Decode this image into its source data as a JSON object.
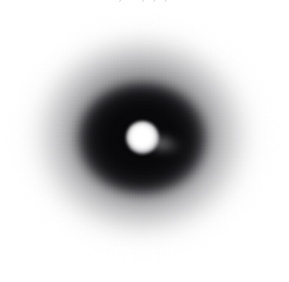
{
  "figure": {
    "kind": "diffraction-pattern-scan",
    "width": 289,
    "height": 282,
    "background_color": "#ffffff",
    "top_clipped_text": ". , . , , , .",
    "ghost_text_lines": [
      "",
      "",
      ""
    ],
    "features": {
      "center_spot": {
        "label": "direct-beam-spot",
        "center_x": 142,
        "center_y": 137,
        "radius": 13,
        "color": "#ffffff"
      },
      "dark_ring": {
        "label": "dark-diffraction-annulus",
        "center_x": 142,
        "center_y": 138,
        "radius_x": 70,
        "radius_y": 62,
        "color": "#0c0c0e"
      },
      "mid_halo": {
        "label": "diffuse-scatter-halo",
        "center_x": 143,
        "center_y": 139,
        "radius_x": 117,
        "radius_y": 108,
        "color": "#686869"
      },
      "outer_halo": {
        "label": "outer-scatter-falloff",
        "center_x": 144,
        "center_y": 141,
        "radius_x": 140,
        "radius_y": 129,
        "color": "#c8c8ca"
      },
      "beamstop_streak": {
        "label": "beamstop-arm-shadow",
        "origin_x": 155,
        "origin_y": 144,
        "angle_degrees": 11,
        "color": "#96969a"
      }
    }
  }
}
